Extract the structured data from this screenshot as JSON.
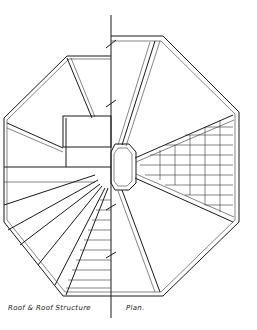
{
  "drawing": {
    "title_left": "Roof & Roof Structure",
    "title_right": "Plan.",
    "subject": "octagonal-roof-plan",
    "left_half": "roof-structure-framing",
    "right_half": "roof-finish-plan"
  }
}
